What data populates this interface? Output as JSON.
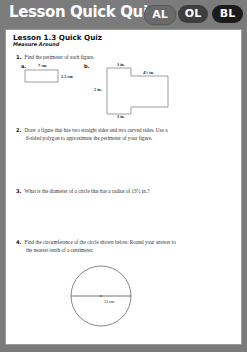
{
  "header": {
    "title": "Lesson Quick Quiz",
    "page_ref": "(p. 39)",
    "levels": [
      {
        "label": "AL",
        "color": "#6a6a6a"
      },
      {
        "label": "OL",
        "color": "#3e3e3e"
      },
      {
        "label": "BL",
        "color": "#1b1b1b"
      }
    ]
  },
  "quiz": {
    "title": "Lesson 1.3 Quick Quiz",
    "subtitle": "Measure Around",
    "questions": [
      {
        "number": "1.",
        "text": "Find the perimeter of each figure.",
        "figures": [
          {
            "label": "a.",
            "shape": "rectangle",
            "width_label": "7 cm",
            "height_label": "2.5 cm"
          },
          {
            "label": "b.",
            "shape": "composite",
            "top_label": "3 in.",
            "step_label": "4½ in.",
            "left_label": "5 in.",
            "bottom_label": "3 in."
          }
        ]
      },
      {
        "number": "2.",
        "text_line1": "Draw a figure that has two straight sides and two curved sides. Use a",
        "text_line2": "6-sided polygon to approximate the perimeter of your figure."
      },
      {
        "number": "3.",
        "text": "What is the diameter of a circle that has a radius of 13½ in.?"
      },
      {
        "number": "4.",
        "text_line1": "Find the circumference of the circle shown below. Round your answer to",
        "text_line2": "the nearest tenth of a centimeter.",
        "figure": {
          "shape": "circle",
          "diameter_label": "13 cm"
        }
      }
    ]
  }
}
